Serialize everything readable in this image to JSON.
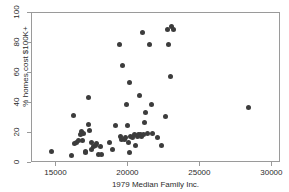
{
  "chart_data": {
    "type": "scatter",
    "title": "",
    "xlabel": "1979 Median Family Inc.",
    "ylabel": "% homes cost $100K+",
    "xlim": [
      13300,
      30600
    ],
    "ylim": [
      0,
      100
    ],
    "xticks": [
      15000,
      20000,
      25000,
      30000
    ],
    "yticks": [
      0,
      20,
      40,
      60,
      80,
      100
    ],
    "xtick_labels": [
      "15000",
      "20000",
      "25000",
      "30000"
    ],
    "ytick_labels": [
      "0",
      "20",
      "40",
      "60",
      "80",
      "100"
    ],
    "grid": false,
    "legend": false,
    "marker": "filled-circle",
    "marker_color": "#3c3c3c",
    "frame_color": "#9a9a9a",
    "n_points": 63,
    "points": [
      {
        "x": 14650,
        "y": 8
      },
      {
        "x": 16050,
        "y": 5
      },
      {
        "x": 16200,
        "y": 32
      },
      {
        "x": 16250,
        "y": 13
      },
      {
        "x": 16400,
        "y": 14
      },
      {
        "x": 16550,
        "y": 15
      },
      {
        "x": 16700,
        "y": 19
      },
      {
        "x": 16750,
        "y": 21
      },
      {
        "x": 16800,
        "y": 15
      },
      {
        "x": 16900,
        "y": 20
      },
      {
        "x": 17000,
        "y": 8
      },
      {
        "x": 17050,
        "y": 7
      },
      {
        "x": 17200,
        "y": 26
      },
      {
        "x": 17250,
        "y": 44
      },
      {
        "x": 17300,
        "y": 22
      },
      {
        "x": 17400,
        "y": 14
      },
      {
        "x": 17450,
        "y": 9
      },
      {
        "x": 17600,
        "y": 11
      },
      {
        "x": 17700,
        "y": 12
      },
      {
        "x": 17800,
        "y": 13
      },
      {
        "x": 17950,
        "y": 6
      },
      {
        "x": 18050,
        "y": 11
      },
      {
        "x": 18100,
        "y": 6
      },
      {
        "x": 18700,
        "y": 14
      },
      {
        "x": 18900,
        "y": 9
      },
      {
        "x": 19100,
        "y": 25
      },
      {
        "x": 19350,
        "y": 79
      },
      {
        "x": 19450,
        "y": 18
      },
      {
        "x": 19550,
        "y": 16
      },
      {
        "x": 19600,
        "y": 65
      },
      {
        "x": 19700,
        "y": 16
      },
      {
        "x": 19800,
        "y": 17
      },
      {
        "x": 19900,
        "y": 39
      },
      {
        "x": 19950,
        "y": 25
      },
      {
        "x": 20000,
        "y": 14
      },
      {
        "x": 20050,
        "y": 54
      },
      {
        "x": 20100,
        "y": 7
      },
      {
        "x": 20150,
        "y": 18
      },
      {
        "x": 20250,
        "y": 17
      },
      {
        "x": 20400,
        "y": 19
      },
      {
        "x": 20500,
        "y": 12
      },
      {
        "x": 20600,
        "y": 18
      },
      {
        "x": 20700,
        "y": 19
      },
      {
        "x": 20800,
        "y": 45
      },
      {
        "x": 20850,
        "y": 19
      },
      {
        "x": 20900,
        "y": 18
      },
      {
        "x": 20950,
        "y": 87
      },
      {
        "x": 21050,
        "y": 19
      },
      {
        "x": 21100,
        "y": 27
      },
      {
        "x": 21200,
        "y": 34
      },
      {
        "x": 21300,
        "y": 20
      },
      {
        "x": 21450,
        "y": 79
      },
      {
        "x": 21600,
        "y": 39
      },
      {
        "x": 21700,
        "y": 20
      },
      {
        "x": 22000,
        "y": 17
      },
      {
        "x": 22300,
        "y": 12
      },
      {
        "x": 22550,
        "y": 31
      },
      {
        "x": 22700,
        "y": 89
      },
      {
        "x": 22750,
        "y": 79
      },
      {
        "x": 22900,
        "y": 58
      },
      {
        "x": 23000,
        "y": 91
      },
      {
        "x": 23100,
        "y": 89
      },
      {
        "x": 28350,
        "y": 37
      }
    ]
  }
}
